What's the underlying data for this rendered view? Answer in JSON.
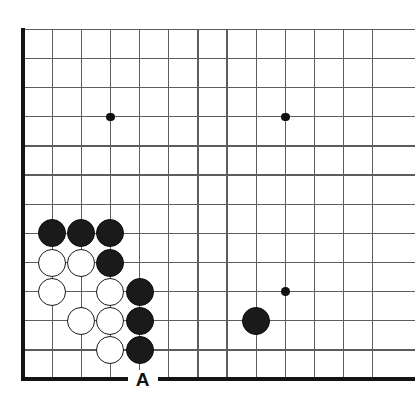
{
  "figure": {
    "kind": "go-board-diagram",
    "width": 415,
    "height": 417,
    "background_color": "#ffffff"
  },
  "board": {
    "columns_visible": 13,
    "rows_visible": 13,
    "grid_spacing": 29.15,
    "origin_x": 23,
    "origin_y": 29.3,
    "line_color": "#5d5d5d",
    "edge_color": "#141414",
    "edges": [
      {
        "name": "left-edge",
        "side": "left"
      },
      {
        "name": "bottom-edge",
        "side": "bottom"
      }
    ],
    "vertical_lines": [
      1,
      2,
      3,
      4,
      5,
      6,
      7,
      8,
      9,
      10,
      11,
      12,
      13
    ],
    "horizontal_lines": [
      1,
      2,
      3,
      4,
      5,
      6,
      7,
      8,
      9,
      10,
      11,
      12,
      13
    ]
  },
  "star_points": [
    {
      "name": "star-point-c4r4",
      "col": 4,
      "row": 4
    },
    {
      "name": "star-point-c10r4",
      "col": 10,
      "row": 4
    },
    {
      "name": "star-point-c10r10",
      "col": 10,
      "row": 10
    }
  ],
  "stones": [
    {
      "name": "black-stone-c2r8",
      "color": "black",
      "col": 2,
      "row": 8
    },
    {
      "name": "black-stone-c3r8",
      "color": "black",
      "col": 3,
      "row": 8
    },
    {
      "name": "black-stone-c4r8",
      "color": "black",
      "col": 4,
      "row": 8
    },
    {
      "name": "white-stone-c2r9",
      "color": "white",
      "col": 2,
      "row": 9
    },
    {
      "name": "white-stone-c3r9",
      "color": "white",
      "col": 3,
      "row": 9
    },
    {
      "name": "black-stone-c4r9",
      "color": "black",
      "col": 4,
      "row": 9
    },
    {
      "name": "white-stone-c2r10",
      "color": "white",
      "col": 2,
      "row": 10
    },
    {
      "name": "white-stone-c4r10",
      "color": "white",
      "col": 4,
      "row": 10
    },
    {
      "name": "black-stone-c5r10",
      "color": "black",
      "col": 5,
      "row": 10
    },
    {
      "name": "white-stone-c3r11",
      "color": "white",
      "col": 3,
      "row": 11
    },
    {
      "name": "white-stone-c4r11",
      "color": "white",
      "col": 4,
      "row": 11
    },
    {
      "name": "black-stone-c5r11",
      "color": "black",
      "col": 5,
      "row": 11
    },
    {
      "name": "black-stone-c9r11",
      "color": "black",
      "col": 9,
      "row": 11
    },
    {
      "name": "white-stone-c4r12",
      "color": "white",
      "col": 4,
      "row": 12
    },
    {
      "name": "black-stone-c5r12",
      "color": "black",
      "col": 5,
      "row": 12
    }
  ],
  "labels": [
    {
      "name": "point-label-a",
      "text": "A",
      "col": 5,
      "row": 13
    }
  ]
}
